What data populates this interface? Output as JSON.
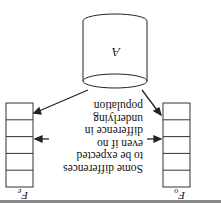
{
  "diagram": {
    "orientation": "rotated-180",
    "population": {
      "label": "A"
    },
    "left_sample": {
      "label": "F",
      "subscript": "o",
      "cells": 5
    },
    "right_sample": {
      "label": "F",
      "subscript": "e",
      "cells": 5
    },
    "caption_lines": [
      "Some differences",
      "to be expected",
      "even if no",
      "difference in underlying",
      "population"
    ],
    "colors": {
      "line": "#222222",
      "background": "#ffffff",
      "rule": "#888888"
    }
  }
}
